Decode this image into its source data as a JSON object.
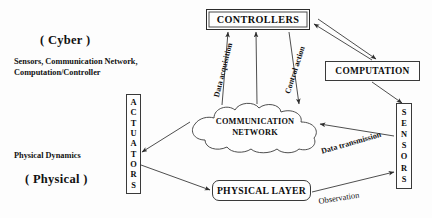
{
  "diagram": {
    "annotations": {
      "cyber_title": "( Cyber )",
      "cyber_subtitle_line1": "Sensors, Communication Network,",
      "cyber_subtitle_line2": "Computation/Controller",
      "physical_subtitle": "Physical Dynamics",
      "physical_title": "( Physical )"
    },
    "nodes": {
      "controllers": "CONTROLLERS",
      "computation": "COMPUTATION",
      "network_line1": "COMMUNICATION",
      "network_line2": "NETWORK",
      "physical_layer": "PHYSICAL LAYER",
      "actuators": "ACTUATORS",
      "sensors": "SENSORS"
    },
    "edge_labels": {
      "data_acquisition": "Data acquisition",
      "control_action": "Control action",
      "data_transmission": "Data transmission",
      "observation": "Observation"
    },
    "edges": [
      {
        "from": "communication-network",
        "to": "controllers",
        "label": "Data acquisition"
      },
      {
        "from": "controllers",
        "to": "communication-network",
        "label": "Control action"
      },
      {
        "from": "controllers",
        "to": "computation",
        "label": ""
      },
      {
        "from": "computation",
        "to": "controllers",
        "label": ""
      },
      {
        "from": "computation",
        "to": "sensors",
        "label": ""
      },
      {
        "from": "sensors",
        "to": "communication-network",
        "label": "Data transmission"
      },
      {
        "from": "physical-layer",
        "to": "sensors",
        "label": "Observation"
      },
      {
        "from": "communication-network",
        "to": "actuators",
        "label": ""
      },
      {
        "from": "actuators",
        "to": "physical-layer",
        "label": ""
      }
    ],
    "colors": {
      "stroke": "#3a3a3a",
      "text": "#0d0d0d",
      "background": "#fdfdfd"
    }
  }
}
